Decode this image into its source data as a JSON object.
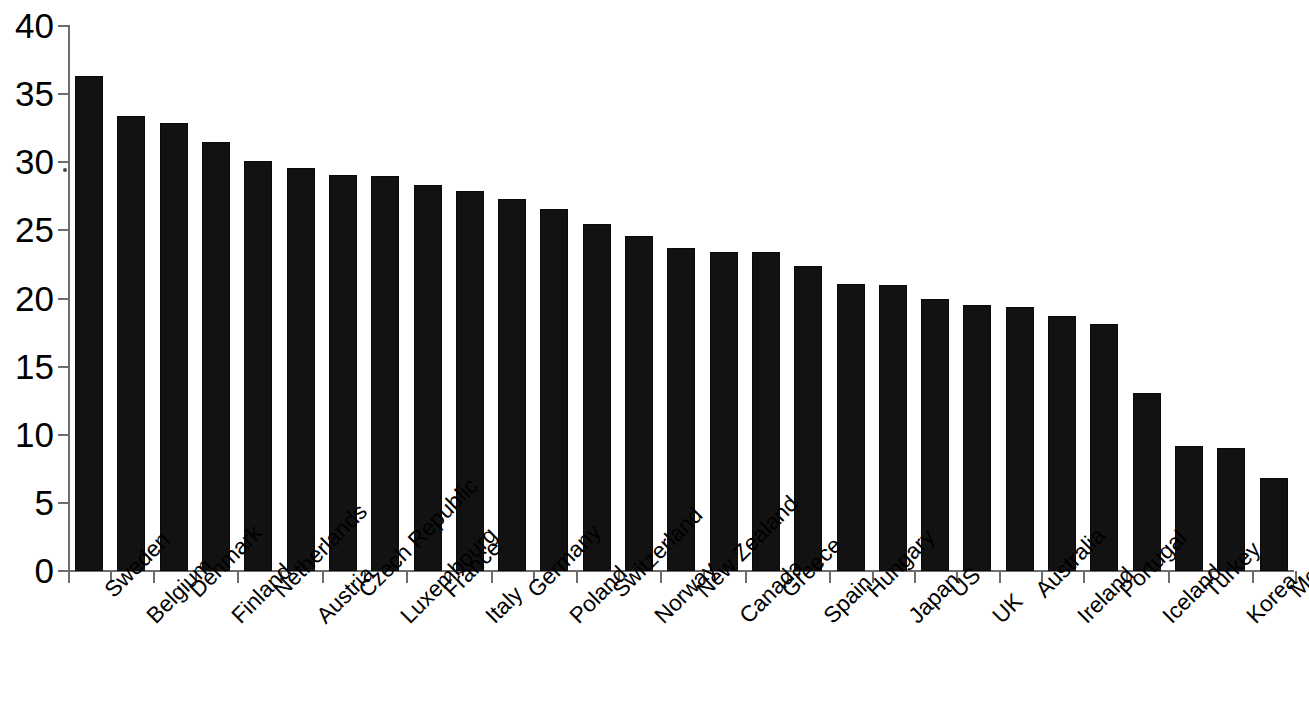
{
  "chart_data": {
    "type": "bar",
    "title": "",
    "subtitle": "",
    "xlabel": "",
    "ylabel": "",
    "ylim": [
      0,
      40
    ],
    "ytick_step": 5,
    "grid": false,
    "legend": null,
    "bar_color": "#121212",
    "axis_color": "#6d6d6d",
    "ytick_labels": [
      "40",
      "35",
      "30",
      "25",
      "20",
      "15",
      "10",
      "5",
      "0"
    ],
    "ytick_values": [
      40,
      35,
      30,
      25,
      20,
      15,
      10,
      5,
      0
    ],
    "categories": [
      "Sweden",
      "Belgium",
      "Denmark",
      "Finland",
      "Netherlands",
      "Austria",
      "Czech Republic",
      "Luxembourg",
      "France",
      "Italy",
      "Germany",
      "Poland",
      "Switzerland",
      "Norway",
      "New Zealand",
      "Canada",
      "Greece",
      "Spain",
      "Hungary",
      "Japan",
      "US",
      "UK",
      "Australia",
      "Ireland",
      "Portugal",
      "Iceland",
      "Turkey",
      "Korea",
      "Mexico"
    ],
    "values": [
      36.3,
      33.4,
      32.9,
      31.5,
      30.1,
      29.6,
      29.1,
      29.0,
      28.3,
      27.9,
      27.3,
      26.6,
      25.5,
      24.6,
      23.7,
      23.4,
      23.4,
      22.4,
      21.1,
      21.0,
      20.0,
      19.5,
      19.4,
      18.7,
      18.1,
      13.1,
      9.2,
      9.0,
      6.8
    ]
  }
}
